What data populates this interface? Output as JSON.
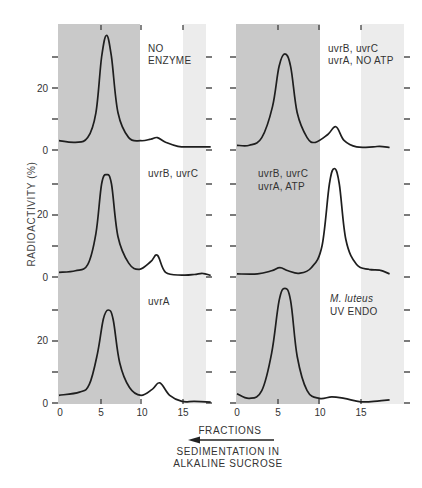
{
  "chart_data": {
    "type": "line",
    "title": "",
    "ylabel": "RADIOACTIVITY (%)",
    "xlabel": "FRACTIONS",
    "annotation": {
      "arrow_direction": "left",
      "text_line1": "SEDIMENTATION IN",
      "text_line2": "ALKALINE SUCROSE"
    },
    "x_ticks": [
      0,
      5,
      10,
      15
    ],
    "y_ticks_labeled": [
      0,
      20
    ],
    "ylim": [
      0,
      40
    ],
    "xlim": [
      0,
      18.5
    ],
    "shading": {
      "dark_region": [
        0,
        10
      ],
      "light_region": [
        15,
        18.5
      ]
    },
    "panels": [
      {
        "id": "top-left",
        "label_lines": [
          "NO",
          "ENZYME"
        ],
        "label_italic_first": false,
        "x": [
          0,
          2,
          3.5,
          4.5,
          5.2,
          5.8,
          6.4,
          7.2,
          8.5,
          10,
          11.2,
          12,
          13,
          14.5,
          16,
          18.5
        ],
        "y": [
          3,
          2.5,
          4,
          12,
          30,
          37,
          30,
          12,
          4,
          3,
          3.5,
          4,
          2.5,
          1.2,
          1,
          1
        ]
      },
      {
        "id": "top-right",
        "label_lines": [
          "uvrB, uvrC",
          "uvrA, NO ATP"
        ],
        "label_italic_first": false,
        "x": [
          0,
          1.5,
          3,
          4.3,
          5.1,
          5.8,
          6.5,
          7.3,
          8.5,
          9.5,
          11,
          12,
          13,
          14.5,
          16.5,
          17.3,
          18.5
        ],
        "y": [
          1.5,
          1.5,
          4,
          14,
          27,
          31,
          27,
          12,
          4,
          2.5,
          5,
          7.5,
          3,
          1,
          1,
          1.2,
          0.8
        ]
      },
      {
        "id": "mid-left",
        "label_lines": [
          "uvrB, uvrC"
        ],
        "label_italic_first": false,
        "x": [
          0,
          2,
          3.5,
          4.5,
          5.2,
          5.8,
          6.4,
          7.2,
          8.5,
          9.8,
          11.2,
          12,
          13,
          15,
          16.5,
          17.5,
          18.5
        ],
        "y": [
          1.5,
          2,
          4,
          14,
          30,
          33,
          30,
          13,
          4.5,
          2.5,
          5,
          7,
          1.5,
          0.6,
          0.8,
          1.2,
          0.5
        ]
      },
      {
        "id": "mid-right",
        "label_lines": [
          "uvrB, uvrC",
          "uvrA, ATP"
        ],
        "label_italic_first": false,
        "x": [
          0,
          2.5,
          4.2,
          5.2,
          6.2,
          7.5,
          9,
          10.3,
          11.2,
          11.8,
          12.4,
          13.2,
          14.5,
          16,
          17.3,
          18.5
        ],
        "y": [
          1,
          1,
          2,
          3,
          2,
          1.2,
          3,
          10,
          30,
          35,
          30,
          12,
          4,
          2.5,
          2.2,
          1
        ]
      },
      {
        "id": "bottom-left",
        "label_lines": [
          "uvrA"
        ],
        "label_italic_first": false,
        "x": [
          0,
          2.5,
          3.7,
          4.7,
          5.4,
          6,
          6.6,
          7.4,
          8.6,
          10,
          11.4,
          12.3,
          13.5,
          15,
          16.5,
          18.5
        ],
        "y": [
          2.5,
          3.5,
          6,
          16,
          27,
          30,
          27,
          13,
          5,
          2.5,
          4.5,
          6.5,
          2.5,
          0.5,
          0.5,
          0.3
        ]
      },
      {
        "id": "bottom-right",
        "label_lines": [
          "M. luteus",
          "UV ENDO"
        ],
        "label_italic_first": true,
        "x": [
          0,
          1.5,
          3,
          4.2,
          5.1,
          5.8,
          6.5,
          7.3,
          8.5,
          10,
          11.5,
          13,
          15,
          17,
          18.5
        ],
        "y": [
          3,
          1.5,
          4,
          16,
          33,
          37,
          33,
          15,
          4,
          1.5,
          2,
          1.5,
          0.4,
          0.6,
          1
        ]
      }
    ]
  },
  "labels": {
    "ylabel": "RADIOACTIVITY (%)",
    "xlabel": "FRACTIONS",
    "sed1": "SEDIMENTATION IN",
    "sed2": "ALKALINE SUCROSE",
    "y0": "0",
    "y20": "20",
    "x0": "0",
    "x5": "5",
    "x10": "10",
    "x15": "15",
    "panel_top_left_1": "NO",
    "panel_top_left_2": "ENZYME",
    "panel_top_right_1": "uvrB, uvrC",
    "panel_top_right_2": "uvrA, NO ATP",
    "panel_mid_left_1": "uvrB, uvrC",
    "panel_mid_right_1": "uvrB, uvrC",
    "panel_mid_right_2": "uvrA, ATP",
    "panel_bottom_left_1": "uvrA",
    "panel_bottom_right_1": "M. luteus",
    "panel_bottom_right_2": "UV ENDO"
  },
  "colors": {
    "dark_shade": "#c9c9c9",
    "light_shade": "#ececec",
    "line": "#1e1e1e"
  }
}
